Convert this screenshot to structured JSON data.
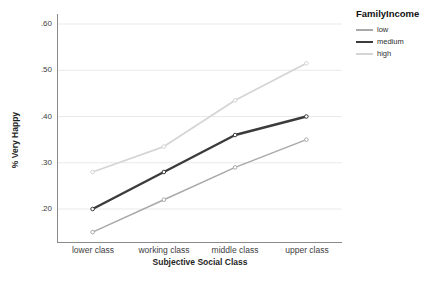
{
  "chart": {
    "y_tick_labels": [
      ".60",
      ".50",
      ".40",
      ".30",
      ".20"
    ]
  },
  "chart_data": {
    "type": "line",
    "title": "",
    "xlabel": "Subjective Social Class",
    "ylabel": "% Very Happy",
    "categories": [
      "lower class",
      "working class",
      "middle class",
      "upper class"
    ],
    "series": [
      {
        "name": "low",
        "values": [
          0.15,
          0.22,
          0.29,
          0.35
        ],
        "color": "#a9a9a9",
        "stroke_width": 1.6
      },
      {
        "name": "medium",
        "values": [
          0.2,
          0.28,
          0.36,
          0.4
        ],
        "color": "#3b3b3b",
        "stroke_width": 2.4
      },
      {
        "name": "high",
        "values": [
          0.28,
          0.335,
          0.435,
          0.515
        ],
        "color": "#d5d5d5",
        "stroke_width": 1.8
      }
    ],
    "y_ticks": [
      0.6,
      0.5,
      0.4,
      0.3,
      0.2
    ],
    "ylim": [
      0.13,
      0.62
    ],
    "grid": true,
    "legend_title": "FamilyIncome",
    "legend_position": "top-right-outside",
    "colors": {
      "gridline": "#e9e9e9",
      "axis_line": "#8a8a8a",
      "tick_text": "#3d3d3d"
    }
  }
}
